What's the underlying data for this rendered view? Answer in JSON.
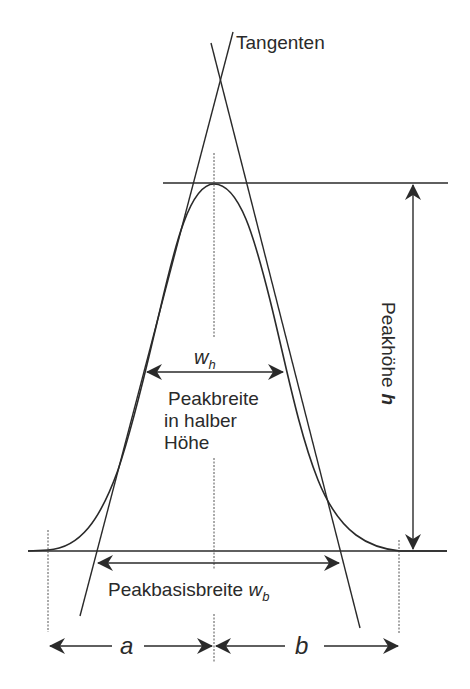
{
  "diagram": {
    "labels": {
      "tangents": "Tangenten",
      "peak_height": "Peakhöhe",
      "peak_height_symbol": "h",
      "half_width_symbol": "w",
      "half_width_sub": "h",
      "half_width_line1": "Peakbreite",
      "half_width_line2": "in halber",
      "half_width_line3": "Höhe",
      "base_width": "Peakbasisbreite ",
      "base_width_symbol": "w",
      "base_width_sub": "b",
      "left_segment": "a",
      "right_segment": "b"
    },
    "colors": {
      "line": "#2a2a2a",
      "dashed": "#555555",
      "background": "#ffffff"
    }
  }
}
